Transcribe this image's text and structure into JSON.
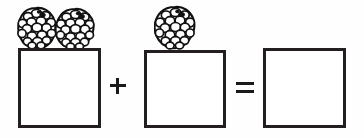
{
  "page": {
    "background_color": "#fefefe",
    "ink_color": "#231f20",
    "width": 364,
    "height": 138
  },
  "equation": {
    "expression": "2 + 1 = ?",
    "addend_1": "2",
    "addend_2": "1",
    "sum": "",
    "plus_label": "+",
    "equals_label": "="
  },
  "terms": [
    {
      "id": "term-1",
      "role": "first-addend",
      "item_name": "berry",
      "item_count": "2",
      "box_label": "",
      "box_state": "empty"
    },
    {
      "id": "term-2",
      "role": "second-addend",
      "item_name": "berry",
      "item_count": "1",
      "box_label": "",
      "box_state": "empty"
    },
    {
      "id": "term-3",
      "role": "sum",
      "item_name": "berry",
      "item_count": "0",
      "box_label": "",
      "box_state": "empty"
    }
  ],
  "operators": [
    {
      "id": "plus",
      "symbol": "+",
      "name": "plus-sign"
    },
    {
      "id": "equals",
      "symbol": "=",
      "name": "equals-sign"
    }
  ]
}
